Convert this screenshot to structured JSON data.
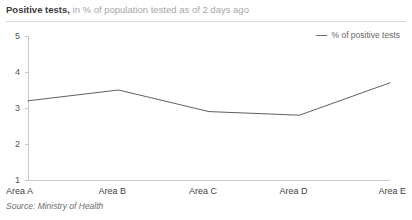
{
  "header": {
    "title_main": "Positive tests,",
    "title_sub": "in % of population tested as of 2 days ago"
  },
  "legend": {
    "swatch_name": "line-swatch",
    "label": "% of positive tests"
  },
  "footer": {
    "source": "Source: Ministry of Health"
  },
  "colors": {
    "series_line": "#5f5f5f",
    "axis": "#c9c9c9",
    "rule": "#d8d8d8",
    "title": "#3a3a3a",
    "subtitle": "#a6a6a6",
    "tick_text": "#555555",
    "category_text": "#3f3f3f",
    "source_text": "#6e6e6e",
    "background": "#ffffff"
  },
  "chart_data": {
    "type": "line",
    "title": "Positive tests, in % of population tested as of 2 days ago",
    "xlabel": "",
    "ylabel": "",
    "categories": [
      "Area A",
      "Area B",
      "Area C",
      "Area D",
      "Area E"
    ],
    "series": [
      {
        "name": "% of positive tests",
        "values": [
          3.2,
          3.5,
          2.9,
          2.8,
          3.7
        ]
      }
    ],
    "ylim": [
      1,
      5
    ],
    "yticks": [
      1,
      2,
      3,
      4,
      5
    ],
    "ytick_labels": [
      "1",
      "2",
      "3",
      "4",
      "5"
    ],
    "grid": false,
    "legend_position": "top-right",
    "markers": false,
    "source": "Source: Ministry of Health"
  }
}
